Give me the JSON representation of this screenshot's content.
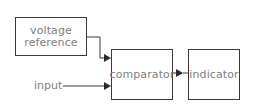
{
  "diagram": {
    "nodes": {
      "voltage_reference": {
        "label_line1": "voltage",
        "label_line2": "reference"
      },
      "comparator": {
        "label": "comparator"
      },
      "indicator": {
        "label": "indicator"
      }
    },
    "inputs": {
      "input_label": "input"
    },
    "edges": [
      {
        "from": "voltage_reference",
        "to": "comparator"
      },
      {
        "from": "input",
        "to": "comparator"
      },
      {
        "from": "comparator",
        "to": "indicator"
      }
    ],
    "colors": {
      "line": "#3a3a3a",
      "text": "#808080"
    }
  }
}
